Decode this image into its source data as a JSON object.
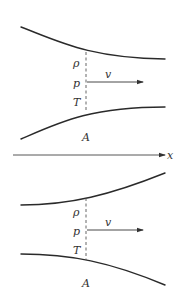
{
  "figure": {
    "axis_label": "x",
    "top_nozzle": {
      "type": "converging",
      "labels": {
        "density": "ρ",
        "pressure": "p",
        "temperature": "T",
        "velocity": "v",
        "area": "A"
      }
    },
    "bottom_nozzle": {
      "type": "diverging",
      "labels": {
        "density": "ρ",
        "pressure": "p",
        "temperature": "T",
        "velocity": "v",
        "area": "A"
      }
    },
    "colors": {
      "line": "#2a2a2a",
      "text": "#333333",
      "background": "#ffffff"
    }
  }
}
